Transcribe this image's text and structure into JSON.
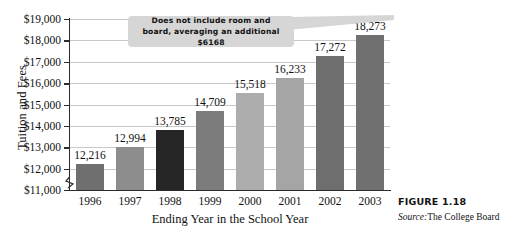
{
  "chart_data": {
    "type": "bar",
    "title": "",
    "xlabel": "Ending Year in the School Year",
    "ylabel": "Tuition and Fees",
    "categories": [
      "1996",
      "1997",
      "1998",
      "1999",
      "2000",
      "2001",
      "2002",
      "2003"
    ],
    "values": [
      12216,
      12994,
      13785,
      14709,
      15518,
      16233,
      17272,
      18273
    ],
    "value_labels": [
      "12,216",
      "12,994",
      "13,785",
      "14,709",
      "15,518",
      "16,233",
      "17,272",
      "18,273"
    ],
    "ylim": [
      11000,
      19000
    ],
    "y_ticks": [
      11000,
      12000,
      13000,
      14000,
      15000,
      16000,
      17000,
      18000,
      19000
    ],
    "y_tick_labels": [
      "$11,000",
      "$12,000",
      "$13,000",
      "$14,000",
      "$15,000",
      "$16,000",
      "$17,000",
      "$18,000",
      "$19,000"
    ],
    "grid": true,
    "legend": "none",
    "y_axis_break": true,
    "bar_colors": [
      "#6f6f6f",
      "#8d8d8d",
      "#262626",
      "#7c7c7c",
      "#adadad",
      "#a5a5a5",
      "#6e6e6e",
      "#707070"
    ],
    "annotations": [
      {
        "name": "room-and-board-note",
        "line1": "Does not include room and",
        "line2": "board, averaging an additional $6168",
        "points_to": "2003",
        "background": "#d6d6d6"
      }
    ]
  },
  "caption": {
    "figure_number": "FIGURE 1.18",
    "source_label": "Source:",
    "source_value": "The College Board"
  }
}
